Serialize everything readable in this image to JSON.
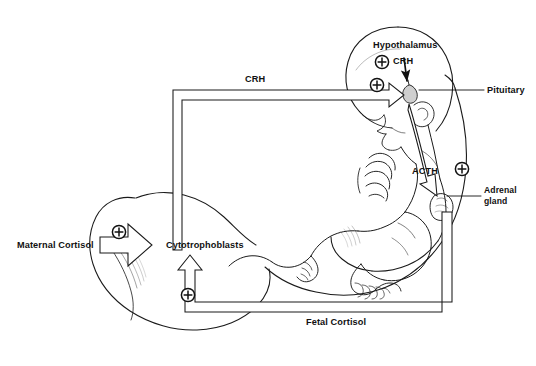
{
  "figure": {
    "background_color": "#ffffff",
    "line_color": "#1a1a1a",
    "text_color": "#111111",
    "width": 536,
    "height": 366
  },
  "labels": {
    "hypothalamus": "Hypothalamus",
    "crh_head": "CRH",
    "crh_flow": "CRH",
    "pituitary": "Pituitary",
    "acth": "ACTH",
    "adrenal_gland_line1": "Adrenal",
    "adrenal_gland_line2": "gland",
    "maternal_cortisol": "Maternal Cortisol",
    "cytotrophoblasts": "Cytotrophoblasts",
    "fetal_cortisol": "Fetal Cortisol"
  },
  "symbols": {
    "plus": "+",
    "plus_count": 5,
    "plus_meaning": "stimulatory / positive feedback"
  },
  "pathways": [
    {
      "name": "hypothalamus-to-pituitary",
      "from": "Hypothalamus",
      "to": "Pituitary",
      "mediator": "CRH",
      "sign": "+",
      "style": "solid-arrow"
    },
    {
      "name": "pituitary-to-adrenal",
      "from": "Pituitary",
      "to": "Adrenal gland",
      "mediator": "ACTH",
      "sign": "+",
      "style": "outlined-block-arrow"
    },
    {
      "name": "adrenal-to-cytotrophoblasts",
      "from": "Adrenal gland",
      "to": "Cytotrophoblasts",
      "mediator": "Fetal Cortisol",
      "sign": "+",
      "style": "outlined-block-arrow"
    },
    {
      "name": "cytotrophoblasts-to-pituitary",
      "from": "Cytotrophoblasts",
      "to": "Pituitary",
      "mediator": "CRH",
      "sign": "+",
      "style": "outlined-block-arrow"
    },
    {
      "name": "maternal-to-cytotrophoblasts",
      "from": "Maternal Cortisol",
      "to": "Cytotrophoblasts",
      "mediator": "Maternal Cortisol",
      "sign": "+",
      "style": "outlined-block-arrow"
    }
  ],
  "anatomy": [
    "fetus-head",
    "fetus-torso",
    "fetus-arm",
    "fetus-legs",
    "fetus-feet",
    "umbilical-cord",
    "placenta",
    "uterine-wall",
    "pituitary-gland",
    "adrenal-gland"
  ],
  "caption_fragment": ""
}
